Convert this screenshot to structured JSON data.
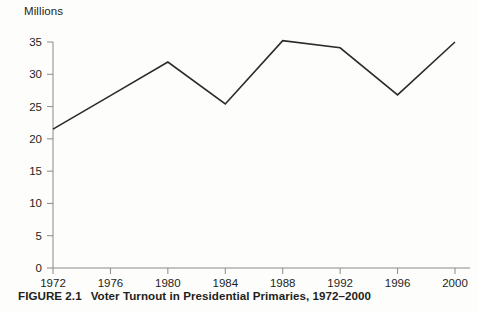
{
  "figure": {
    "caption_number": "FIGURE 2.1",
    "caption_text": "Voter Turnout in Presidential Primaries, 1972–2000",
    "y_axis_unit_label": "Millions"
  },
  "chart_data": {
    "type": "line",
    "title": "Voter Turnout in Presidential Primaries, 1972–2000",
    "xlabel": "",
    "ylabel": "Millions",
    "categories": [
      "1972",
      "1976",
      "1980",
      "1984",
      "1988",
      "1992",
      "1996",
      "2000"
    ],
    "values": [
      21.5,
      26.7,
      31.9,
      25.4,
      35.2,
      34.1,
      26.8,
      35.0
    ],
    "x_tick_labels": [
      "1972",
      "1976",
      "1980",
      "1984",
      "1988",
      "1992",
      "1996",
      "2000"
    ],
    "y_tick_labels": [
      "0",
      "5",
      "10",
      "15",
      "20",
      "25",
      "30",
      "35"
    ],
    "y_ticks": [
      0,
      5,
      10,
      15,
      20,
      25,
      30,
      35
    ],
    "ylim": [
      0,
      35
    ],
    "grid": false,
    "legend": false,
    "line_color": "#2b2b2b",
    "axis_color": "#8a8a8a",
    "background_color": "#fdfdfc"
  }
}
